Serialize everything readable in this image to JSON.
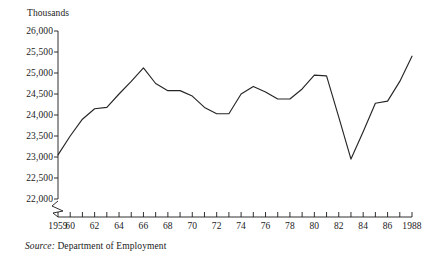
{
  "figure": {
    "unit_label": "Thousands",
    "source_word": "Source:",
    "source_text": "Department of Employment"
  },
  "chart_data": {
    "type": "line",
    "title": "",
    "subtitle": "",
    "xlabel": "",
    "ylabel": "Thousands",
    "ylim": [
      22000,
      26000
    ],
    "xlim": [
      1959,
      1988
    ],
    "grid": false,
    "legend": "none",
    "axis_break": true,
    "axis_break_note": "Y axis broken below 22,000 (zigzag at origin)",
    "ytick_labels": [
      "26,000",
      "25,500",
      "25,000",
      "24,500",
      "24,000",
      "23,500",
      "23,000",
      "22,500",
      "22,000"
    ],
    "ytick_values": [
      26000,
      25500,
      25000,
      24500,
      24000,
      23500,
      23000,
      22500,
      22000
    ],
    "xtick_labels": [
      "1959",
      "60",
      "",
      "62",
      "",
      "64",
      "",
      "66",
      "",
      "68",
      "",
      "70",
      "",
      "72",
      "",
      "74",
      "",
      "76",
      "",
      "78",
      "",
      "80",
      "",
      "82",
      "",
      "84",
      "",
      "86",
      "",
      "1988"
    ],
    "xtick_values": [
      1959,
      1960,
      1961,
      1962,
      1963,
      1964,
      1965,
      1966,
      1967,
      1968,
      1969,
      1970,
      1971,
      1972,
      1973,
      1974,
      1975,
      1976,
      1977,
      1978,
      1979,
      1980,
      1981,
      1982,
      1983,
      1984,
      1985,
      1986,
      1987,
      1988
    ],
    "x": [
      1959,
      1960,
      1961,
      1962,
      1963,
      1964,
      1965,
      1966,
      1967,
      1968,
      1969,
      1970,
      1971,
      1972,
      1973,
      1974,
      1975,
      1976,
      1977,
      1978,
      1979,
      1980,
      1981,
      1982,
      1983,
      1984,
      1985,
      1986,
      1987,
      1988
    ],
    "values": [
      23050,
      23500,
      23900,
      24150,
      24180,
      24500,
      24800,
      25120,
      24750,
      24580,
      24580,
      24450,
      24180,
      24030,
      24030,
      24500,
      24680,
      24550,
      24380,
      24380,
      24620,
      24950,
      24930,
      23950,
      22950,
      23600,
      24280,
      24330,
      24800,
      25400
    ],
    "series": [
      {
        "name": "Employed labour force",
        "values": [
          23050,
          23500,
          23900,
          24150,
          24180,
          24500,
          24800,
          25120,
          24750,
          24580,
          24580,
          24450,
          24180,
          24030,
          24030,
          24500,
          24680,
          24550,
          24380,
          24380,
          24620,
          24950,
          24930,
          23950,
          22950,
          23600,
          24280,
          24330,
          24800,
          25400
        ]
      }
    ]
  }
}
